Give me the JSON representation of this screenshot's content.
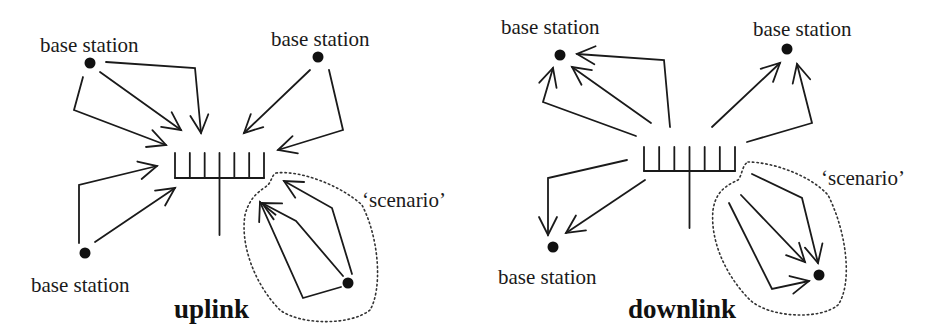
{
  "panels": [
    {
      "id": "uplink",
      "title": "uplink",
      "direction": "to-antenna",
      "station_label": "base station",
      "scenario_label": "‘scenario’",
      "stations": [
        {
          "id": "top-left",
          "label": "base station",
          "paths": 3
        },
        {
          "id": "top-right",
          "label": "base station",
          "paths": 2
        },
        {
          "id": "bottom-left",
          "label": "base station",
          "paths": 2
        },
        {
          "id": "scenario",
          "label": "",
          "paths": 3,
          "in_scenario": true
        }
      ],
      "antenna": {
        "elements": 7
      }
    },
    {
      "id": "downlink",
      "title": "downlink",
      "direction": "from-antenna",
      "station_label": "base station",
      "scenario_label": "‘scenario’",
      "stations": [
        {
          "id": "top-left",
          "label": "base station",
          "paths": 3
        },
        {
          "id": "top-right",
          "label": "base station",
          "paths": 2
        },
        {
          "id": "bottom-left",
          "label": "base station",
          "paths": 2
        },
        {
          "id": "scenario",
          "label": "",
          "paths": 3,
          "in_scenario": true
        }
      ],
      "antenna": {
        "elements": 7
      }
    }
  ],
  "colors": {
    "ink": "#1a1a1a",
    "background": "#ffffff"
  }
}
